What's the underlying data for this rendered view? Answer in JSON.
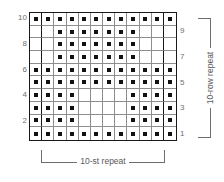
{
  "chart_data": {
    "type": "heatmap",
    "title": "",
    "xlabel": "10-st repeat",
    "ylabel": "10-row repeat",
    "columns": 12,
    "rows": 10,
    "grid_on": true,
    "legend_position": "none",
    "symbol": "purl-dot",
    "symbol_color": "#111111",
    "cell_border_color": "#8d8e90",
    "outline_color": "#1a1a1a",
    "repeat_line_color": "#1a1a1a",
    "repeat_columns": [
      2,
      11
    ],
    "xlim": [
      1,
      12
    ],
    "ylim": [
      1,
      10
    ],
    "column_numbers": [
      1,
      2,
      3,
      4,
      5,
      6,
      7,
      8,
      9,
      10,
      11,
      12
    ],
    "row_numbers_left": [
      "10",
      "",
      "8",
      "",
      "6",
      "",
      "4",
      "",
      "2",
      ""
    ],
    "row_numbers_right": [
      "",
      "9",
      "",
      "7",
      "",
      "5",
      "",
      "3",
      "",
      "1"
    ],
    "rows_top_to_bottom": [
      {
        "row": 10,
        "cells": [
          1,
          1,
          1,
          1,
          1,
          1,
          1,
          1,
          1,
          1,
          1,
          1
        ]
      },
      {
        "row": 9,
        "cells": [
          0,
          0,
          1,
          1,
          1,
          1,
          1,
          1,
          1,
          0,
          0,
          0
        ]
      },
      {
        "row": 8,
        "cells": [
          0,
          0,
          1,
          1,
          1,
          1,
          1,
          1,
          1,
          0,
          0,
          0
        ]
      },
      {
        "row": 7,
        "cells": [
          0,
          0,
          1,
          1,
          1,
          1,
          1,
          1,
          1,
          0,
          0,
          0
        ]
      },
      {
        "row": 6,
        "cells": [
          1,
          1,
          1,
          1,
          1,
          1,
          1,
          1,
          1,
          1,
          1,
          1
        ]
      },
      {
        "row": 5,
        "cells": [
          1,
          1,
          1,
          1,
          1,
          1,
          1,
          1,
          1,
          1,
          1,
          1
        ]
      },
      {
        "row": 4,
        "cells": [
          1,
          1,
          1,
          1,
          0,
          0,
          0,
          0,
          1,
          1,
          1,
          1
        ]
      },
      {
        "row": 3,
        "cells": [
          1,
          1,
          1,
          1,
          0,
          0,
          0,
          0,
          1,
          1,
          1,
          1
        ]
      },
      {
        "row": 2,
        "cells": [
          1,
          1,
          1,
          1,
          0,
          0,
          0,
          0,
          1,
          1,
          1,
          1
        ]
      },
      {
        "row": 1,
        "cells": [
          1,
          1,
          1,
          1,
          1,
          1,
          1,
          1,
          1,
          1,
          1,
          1
        ]
      }
    ]
  },
  "labels": {
    "stitch_repeat": "10-st repeat",
    "row_repeat": "10-row repeat"
  }
}
